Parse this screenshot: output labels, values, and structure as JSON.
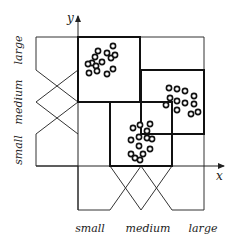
{
  "diagram": {
    "title": "",
    "axes": {
      "x_label": "x",
      "y_label": "y"
    },
    "x_terms": [
      "small",
      "medium",
      "large"
    ],
    "y_terms": [
      "small",
      "medium",
      "large"
    ],
    "rules": [
      {
        "x": "small",
        "y": "large",
        "cluster": "top-left"
      },
      {
        "x": "large",
        "y": "medium",
        "cluster": "right"
      },
      {
        "x": "medium",
        "y": "small",
        "cluster": "center"
      }
    ],
    "colors": {
      "line": "#222222",
      "background": "#ffffff"
    }
  },
  "clusters": {
    "top_left": [
      [
        113,
        46
      ],
      [
        107,
        53
      ],
      [
        98,
        51
      ],
      [
        95,
        57
      ],
      [
        111,
        58
      ],
      [
        115,
        55
      ],
      [
        92,
        63
      ],
      [
        102,
        62
      ],
      [
        96,
        66
      ],
      [
        88,
        64
      ],
      [
        113,
        69
      ],
      [
        89,
        73
      ],
      [
        97,
        71
      ],
      [
        107,
        74
      ]
    ],
    "right": [
      [
        169,
        88
      ],
      [
        177,
        89
      ],
      [
        185,
        91
      ],
      [
        194,
        96
      ],
      [
        170,
        98
      ],
      [
        177,
        101
      ],
      [
        185,
        103
      ],
      [
        194,
        104
      ],
      [
        166,
        105
      ],
      [
        177,
        110
      ],
      [
        191,
        114
      ],
      [
        198,
        112
      ]
    ],
    "center": [
      [
        133,
        128
      ],
      [
        140,
        125
      ],
      [
        150,
        124
      ],
      [
        147,
        131
      ],
      [
        131,
        140
      ],
      [
        139,
        137
      ],
      [
        147,
        138
      ],
      [
        152,
        139
      ],
      [
        139,
        146
      ],
      [
        150,
        149
      ],
      [
        131,
        154
      ],
      [
        135,
        158
      ],
      [
        143,
        154
      ],
      [
        140,
        160
      ]
    ]
  }
}
